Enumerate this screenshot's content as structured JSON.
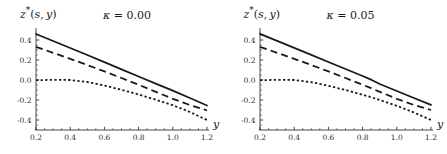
{
  "figure": {
    "width": 447,
    "height": 154,
    "background": "#ffffff",
    "line_color": "#1a1a1a"
  },
  "chart_data": [
    {
      "type": "line",
      "panel_index": 0,
      "title": "",
      "ylabel": "z*(s, y)",
      "ylabel_plain": "z*(s,y)",
      "annotation": "κ = 0.00",
      "kappa_symbol": "κ",
      "kappa_equals": "=",
      "kappa_value": "0.00",
      "xlabel": "y",
      "xlim": [
        0.2,
        1.2
      ],
      "ylim": [
        -0.5,
        0.5
      ],
      "xticks": [
        0.2,
        0.4,
        0.6,
        0.8,
        1.0,
        1.2
      ],
      "xticklabels": [
        "0.2",
        "0.4",
        "0.6",
        "0.8",
        "1.0",
        "1.2"
      ],
      "yticks": [
        0.4,
        0.2,
        0.0,
        -0.2,
        -0.4
      ],
      "yticklabels": [
        "0.4",
        "0.2",
        "0.0",
        "-0.2",
        "-0.4"
      ],
      "grid": false,
      "legend": null,
      "x": [
        0.2,
        0.3,
        0.4,
        0.5,
        0.6,
        0.7,
        0.8,
        0.9,
        1.0,
        1.1,
        1.2
      ],
      "series": [
        {
          "name": "solid",
          "style": "solid",
          "values": [
            0.46,
            0.39,
            0.32,
            0.25,
            0.178,
            0.106,
            0.035,
            -0.036,
            -0.107,
            -0.18,
            -0.255
          ]
        },
        {
          "name": "dashed",
          "style": "dashed",
          "values": [
            0.332,
            0.272,
            0.212,
            0.15,
            0.086,
            0.02,
            -0.048,
            -0.118,
            -0.188,
            -0.25,
            -0.305
          ]
        },
        {
          "name": "dotted",
          "style": "dotted",
          "values": [
            -0.002,
            0.002,
            0.0,
            -0.02,
            -0.055,
            -0.098,
            -0.145,
            -0.197,
            -0.252,
            -0.32,
            -0.4
          ]
        }
      ]
    },
    {
      "type": "line",
      "panel_index": 1,
      "title": "",
      "ylabel": "z*(s, y)",
      "ylabel_plain": "z*(s,y)",
      "annotation": "κ = 0.05",
      "kappa_symbol": "κ",
      "kappa_equals": "=",
      "kappa_value": "0.05",
      "xlabel": "y",
      "xlim": [
        0.2,
        1.2
      ],
      "ylim": [
        -0.5,
        0.5
      ],
      "xticks": [
        0.2,
        0.4,
        0.6,
        0.8,
        1.0,
        1.2
      ],
      "xticklabels": [
        "0.2",
        "0.4",
        "0.6",
        "0.8",
        "1.0",
        "1.2"
      ],
      "yticks": [
        0.4,
        0.2,
        0.0,
        -0.2,
        -0.4
      ],
      "yticklabels": [
        "0.4",
        "0.2",
        "0.0",
        "-0.2",
        "-0.4"
      ],
      "grid": false,
      "legend": null,
      "x": [
        0.2,
        0.3,
        0.4,
        0.5,
        0.6,
        0.7,
        0.8,
        0.85,
        0.9,
        1.0,
        1.1,
        1.2
      ],
      "series": [
        {
          "name": "solid",
          "style": "solid",
          "values": [
            0.462,
            0.392,
            0.322,
            0.252,
            0.18,
            0.11,
            0.04,
            0.003,
            -0.04,
            -0.11,
            -0.18,
            -0.248
          ]
        },
        {
          "name": "dashed",
          "style": "dashed",
          "values": [
            0.332,
            0.272,
            0.212,
            0.15,
            0.086,
            0.02,
            -0.048,
            -0.082,
            -0.118,
            -0.188,
            -0.25,
            -0.3
          ]
        },
        {
          "name": "dotted",
          "style": "dotted",
          "values": [
            -0.002,
            0.002,
            0.0,
            -0.022,
            -0.058,
            -0.1,
            -0.148,
            -0.172,
            -0.2,
            -0.258,
            -0.325,
            -0.4
          ]
        }
      ]
    }
  ]
}
